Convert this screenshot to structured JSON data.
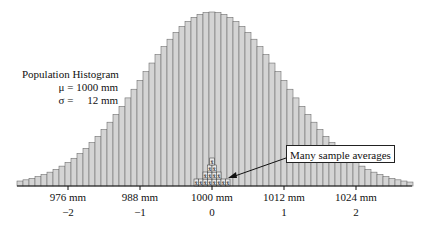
{
  "population": {
    "title": "Population Histogram",
    "mean_line": "μ = 1000 mm",
    "sd_line": "σ =     12 mm"
  },
  "callout": {
    "label": "Many sample averages"
  },
  "axis": {
    "ticks": [
      {
        "mm": "976 mm",
        "z": "−2"
      },
      {
        "mm": "988 mm",
        "z": "−1"
      },
      {
        "mm": "1000 mm",
        "z": "0"
      },
      {
        "mm": "1012 mm",
        "z": "1"
      },
      {
        "mm": "1024 mm",
        "z": "2"
      }
    ]
  },
  "sample_marker": "x̄",
  "chart_data": {
    "type": "bar",
    "title": "Population Histogram",
    "annotations": [
      "μ = 1000 mm",
      "σ = 12 mm",
      "Many sample averages"
    ],
    "xlabel": "mm (and standard deviations from mean)",
    "x_ticks": [
      976,
      988,
      1000,
      1012,
      1024
    ],
    "x_ticks_z": [
      -2,
      -1,
      0,
      1,
      2
    ],
    "xlim": [
      968,
      1033
    ],
    "bin_width_mm": 1,
    "distribution": "normal",
    "mean": 1000,
    "sd": 12,
    "sample_averages_stack_rows": [
      8,
      4,
      2,
      1
    ],
    "colors": {
      "bar_fill": "#d4d4d4",
      "bar_edge": "#6e6e6e",
      "axis": "#111111"
    }
  }
}
